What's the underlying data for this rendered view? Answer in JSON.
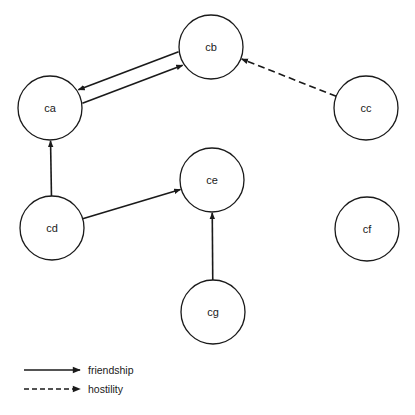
{
  "diagram": {
    "type": "directed-graph",
    "nodes": [
      {
        "id": "ca",
        "label": "ca"
      },
      {
        "id": "cb",
        "label": "cb"
      },
      {
        "id": "cc",
        "label": "cc"
      },
      {
        "id": "cd",
        "label": "cd"
      },
      {
        "id": "ce",
        "label": "ce"
      },
      {
        "id": "cf",
        "label": "cf"
      },
      {
        "id": "cg",
        "label": "cg"
      }
    ],
    "edges": [
      {
        "from": "ca",
        "to": "cb",
        "relation": "friendship"
      },
      {
        "from": "cb",
        "to": "ca",
        "relation": "friendship"
      },
      {
        "from": "cc",
        "to": "cb",
        "relation": "hostility"
      },
      {
        "from": "cd",
        "to": "ca",
        "relation": "friendship"
      },
      {
        "from": "cd",
        "to": "ce",
        "relation": "friendship"
      },
      {
        "from": "cg",
        "to": "ce",
        "relation": "friendship"
      }
    ],
    "legend": [
      {
        "relation": "friendship",
        "style": "solid",
        "label": "friendship"
      },
      {
        "relation": "hostility",
        "style": "dashed",
        "label": "hostility"
      }
    ],
    "colors": {
      "stroke": "#1a1a1a",
      "background": "#ffffff"
    }
  }
}
